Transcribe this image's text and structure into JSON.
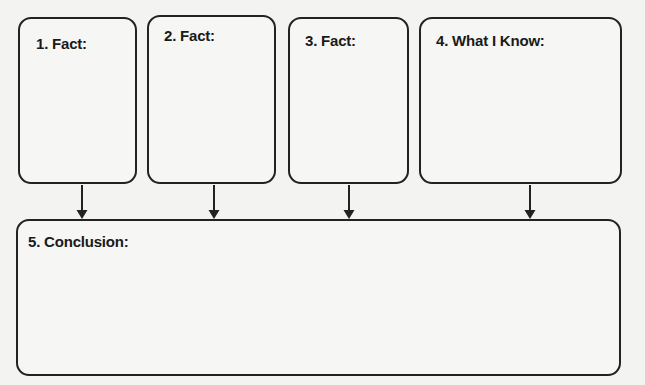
{
  "diagram": {
    "type": "graphic-organizer",
    "boxes": [
      {
        "id": 1,
        "label": "1. Fact:",
        "content": ""
      },
      {
        "id": 2,
        "label": "2. Fact:",
        "content": ""
      },
      {
        "id": 3,
        "label": "3. Fact:",
        "content": ""
      },
      {
        "id": 4,
        "label": "4. What I Know:",
        "content": ""
      },
      {
        "id": 5,
        "label": "5. Conclusion:",
        "content": ""
      }
    ],
    "arrows": [
      {
        "from": 1,
        "to": 5
      },
      {
        "from": 2,
        "to": 5
      },
      {
        "from": 3,
        "to": 5
      },
      {
        "from": 4,
        "to": 5
      }
    ],
    "colors": {
      "background": "#f3f3f2",
      "stroke": "#222222",
      "text": "#1a1a1a"
    }
  }
}
